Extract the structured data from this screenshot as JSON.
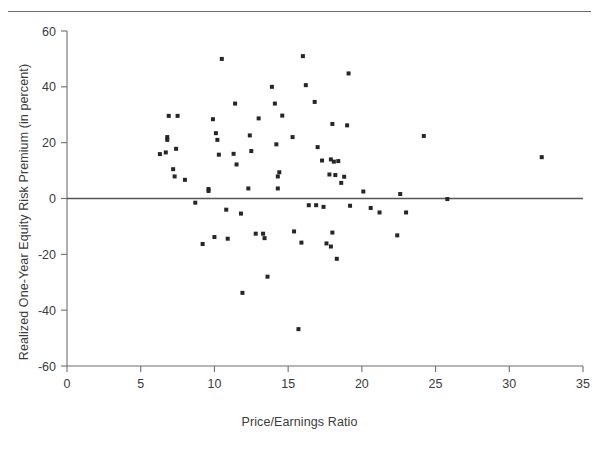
{
  "figure": {
    "has_top_rule": true,
    "background_color": "#ffffff",
    "ink_color": "#26262a",
    "axis_color": "#6e6e6e"
  },
  "chart_data": {
    "type": "scatter",
    "title": "",
    "xlabel": "Price/Earnings Ratio",
    "ylabel": "Realized One-Year Equity Risk Premium (in percent)",
    "xlim": [
      0,
      35
    ],
    "ylim": [
      -60,
      60
    ],
    "xticks": [
      0,
      5,
      10,
      15,
      20,
      25,
      30,
      35
    ],
    "yticks": [
      -60,
      -40,
      -20,
      0,
      20,
      40,
      60
    ],
    "xtick_labels": [
      "0",
      "5",
      "10",
      "15",
      "20",
      "25",
      "30",
      "35"
    ],
    "ytick_labels": [
      "-60",
      "-40",
      "-20",
      "0",
      "20",
      "40",
      "60"
    ],
    "grid": false,
    "legend": null,
    "reference_lines": [
      {
        "orientation": "horizontal",
        "value": 0,
        "color": "#555555"
      }
    ],
    "marker": "square",
    "marker_size_px": 4,
    "series": [
      {
        "name": "P/E vs realized equity risk premium",
        "points": [
          [
            6.7,
            16.5
          ],
          [
            7.5,
            29.6
          ],
          [
            6.9,
            29.6
          ],
          [
            6.8,
            22.0
          ],
          [
            6.8,
            21.0
          ],
          [
            7.4,
            17.8
          ],
          [
            6.3,
            15.9
          ],
          [
            7.2,
            10.5
          ],
          [
            7.3,
            7.9
          ],
          [
            8.0,
            6.7
          ],
          [
            8.7,
            -1.5
          ],
          [
            9.2,
            -16.3
          ],
          [
            9.6,
            3.4
          ],
          [
            9.6,
            2.7
          ],
          [
            10.1,
            23.4
          ],
          [
            9.9,
            28.4
          ],
          [
            10.0,
            -13.8
          ],
          [
            10.5,
            50.0
          ],
          [
            10.2,
            21.0
          ],
          [
            10.3,
            15.7
          ],
          [
            10.8,
            -4.0
          ],
          [
            10.9,
            -14.4
          ],
          [
            11.4,
            34.0
          ],
          [
            11.3,
            16.0
          ],
          [
            11.5,
            12.2
          ],
          [
            11.8,
            -5.4
          ],
          [
            11.9,
            -33.8
          ],
          [
            12.4,
            22.6
          ],
          [
            12.3,
            3.6
          ],
          [
            12.5,
            17.0
          ],
          [
            12.8,
            -12.6
          ],
          [
            13.3,
            -12.6
          ],
          [
            13.4,
            -14.2
          ],
          [
            13.0,
            28.7
          ],
          [
            13.6,
            -28.0
          ],
          [
            13.9,
            40.0
          ],
          [
            14.1,
            34.0
          ],
          [
            14.2,
            19.4
          ],
          [
            14.3,
            7.9
          ],
          [
            14.4,
            9.4
          ],
          [
            14.3,
            3.6
          ],
          [
            14.6,
            29.7
          ],
          [
            15.3,
            22.0
          ],
          [
            15.4,
            -11.8
          ],
          [
            15.7,
            -46.8
          ],
          [
            16.0,
            51.0
          ],
          [
            16.2,
            40.6
          ],
          [
            15.9,
            -15.8
          ],
          [
            16.4,
            -2.4
          ],
          [
            16.9,
            -2.4
          ],
          [
            16.8,
            34.6
          ],
          [
            17.0,
            18.4
          ],
          [
            17.3,
            13.6
          ],
          [
            17.4,
            -3.0
          ],
          [
            17.6,
            -16.1
          ],
          [
            17.8,
            8.6
          ],
          [
            17.9,
            14.0
          ],
          [
            18.0,
            26.7
          ],
          [
            18.1,
            13.2
          ],
          [
            18.2,
            8.4
          ],
          [
            18.0,
            -12.2
          ],
          [
            17.9,
            -17.2
          ],
          [
            18.4,
            13.4
          ],
          [
            18.3,
            -21.6
          ],
          [
            18.6,
            5.6
          ],
          [
            18.8,
            7.8
          ],
          [
            19.1,
            44.8
          ],
          [
            19.0,
            26.2
          ],
          [
            19.2,
            -2.6
          ],
          [
            20.1,
            2.5
          ],
          [
            20.6,
            -3.4
          ],
          [
            21.2,
            -5.0
          ],
          [
            22.4,
            -13.2
          ],
          [
            22.6,
            1.6
          ],
          [
            23.0,
            -5.0
          ],
          [
            24.2,
            22.4
          ],
          [
            25.8,
            -0.2
          ],
          [
            32.2,
            14.8
          ]
        ]
      }
    ]
  }
}
